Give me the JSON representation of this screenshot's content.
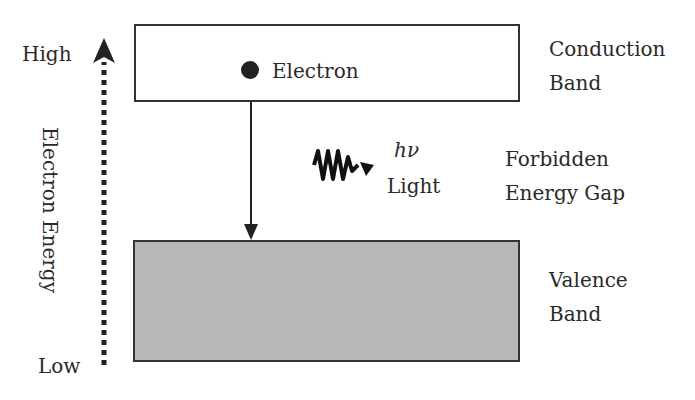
{
  "diagram": {
    "axis": {
      "high_label": "High",
      "low_label": "Low",
      "title": "Electron Energy"
    },
    "conduction_band": {
      "label_line1": "Conduction",
      "label_line2": "Band"
    },
    "valence_band": {
      "label_line1": "Valence",
      "label_line2": "Band"
    },
    "gap": {
      "label_line1": "Forbidden",
      "label_line2": "Energy Gap"
    },
    "electron": {
      "label": "Electron"
    },
    "photon": {
      "symbol": "hν",
      "label": "Light"
    },
    "colors": {
      "valence_fill": "#b8b8b8",
      "stroke": "#333333"
    }
  }
}
